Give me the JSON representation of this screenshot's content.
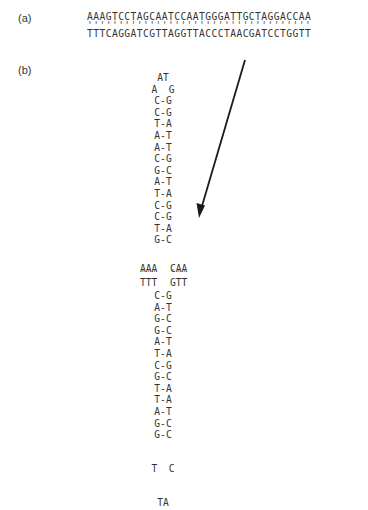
{
  "panel_a": {
    "label": "(a)",
    "top_strand": "AAAGTCCTAGCAATCCAATGGGATTGCTAGGACCAA",
    "bond_marks": "''''''''''''''''''''''''''''''''''''",
    "bottom_strand": "TTTCAGGATCGTTAGGTTACCCTAACGATCCTGGTT"
  },
  "panel_b": {
    "label": "(b)",
    "upper_loop": [
      "AT",
      "A  G"
    ],
    "upper_stem": [
      "C-G",
      "C-G",
      "T-A",
      "A-T",
      "A-T",
      "C-G",
      "G-C",
      "A-T",
      "T-A",
      "C-G",
      "C-G",
      "T-A",
      "G-C"
    ],
    "junction": {
      "left_top": "AAA",
      "left_bonds": "'''",
      "left_bottom": "TTT",
      "right_top": "CAA",
      "right_bonds": "'''",
      "right_bottom": "GTT"
    },
    "lower_stem": [
      "C-G",
      "A-T",
      "G-C",
      "G-C",
      "A-T",
      "T-A",
      "C-G",
      "G-C",
      "T-A",
      "T-A",
      "A-T",
      "G-C",
      "G-C"
    ],
    "lower_loop": [
      "T  C",
      "TA"
    ]
  },
  "arrow": {
    "from": [
      245,
      60
    ],
    "to": [
      199,
      217
    ],
    "color": "#1a1a1a"
  }
}
